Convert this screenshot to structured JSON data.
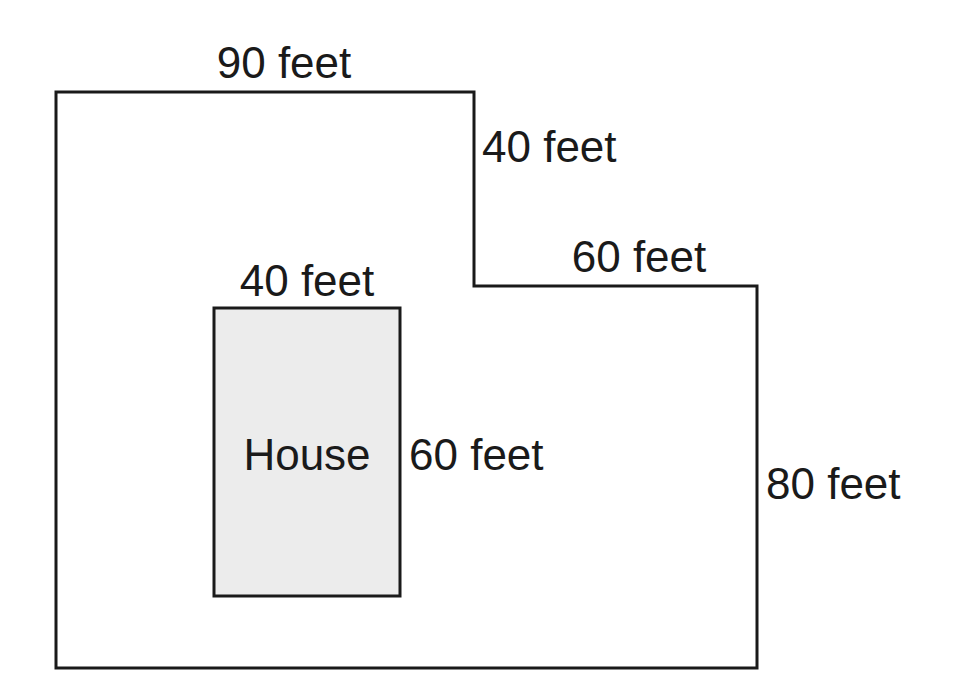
{
  "diagram": {
    "type": "property-lot-plan",
    "colors": {
      "outline": "#1a1a1a",
      "house_fill": "#ececec",
      "background": "#ffffff",
      "text": "#1a1a1a"
    },
    "lot": {
      "shape": "L-shaped lot boundary",
      "labels": {
        "top_edge": "90 feet",
        "inner_vertical_edge": "40 feet",
        "inner_horizontal_edge": "60 feet",
        "right_edge": "80 feet"
      },
      "dimensions_ft": {
        "top": 90,
        "inner_vertical": 40,
        "inner_horizontal": 60,
        "right": 80
      }
    },
    "house": {
      "label": "House",
      "labels": {
        "width": "40 feet",
        "height": "60 feet"
      },
      "dimensions_ft": {
        "width": 40,
        "height": 60
      }
    }
  }
}
